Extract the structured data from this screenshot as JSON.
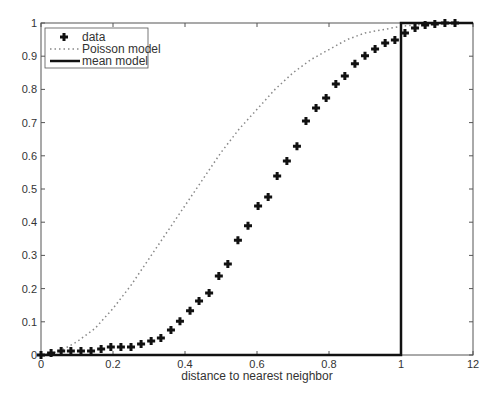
{
  "chart_data": {
    "type": "line",
    "title": "",
    "xlabel": "distance to nearest neighbor",
    "ylabel": "",
    "xlim": [
      0,
      1.2
    ],
    "ylim": [
      0,
      1
    ],
    "xticks": [
      "0",
      "0.2",
      "0.4",
      "0.6",
      "0.8",
      "1",
      "1.2"
    ],
    "yticks": [
      "0",
      "0.1",
      "0.2",
      "0.3",
      "0.4",
      "0.5",
      "0.6",
      "0.7",
      "0.8",
      "0.9",
      "1"
    ],
    "grid": false,
    "legend_position": "upper-left",
    "legend": [
      "data",
      "Poisson model",
      "mean model"
    ],
    "series": [
      {
        "name": "data",
        "style": "markers-plus",
        "x": [
          0,
          0.028,
          0.056,
          0.083,
          0.111,
          0.139,
          0.167,
          0.194,
          0.222,
          0.25,
          0.278,
          0.306,
          0.333,
          0.361,
          0.386,
          0.414,
          0.439,
          0.467,
          0.494,
          0.519,
          0.547,
          0.575,
          0.603,
          0.631,
          0.656,
          0.683,
          0.711,
          0.736,
          0.764,
          0.792,
          0.819,
          0.844,
          0.872,
          0.9,
          0.928,
          0.956,
          0.983,
          1.011,
          1.039,
          1.067,
          1.094,
          1.122,
          1.15
        ],
        "y": [
          0,
          0.006,
          0.012,
          0.012,
          0.012,
          0.012,
          0.018,
          0.024,
          0.024,
          0.024,
          0.033,
          0.042,
          0.051,
          0.075,
          0.102,
          0.133,
          0.163,
          0.187,
          0.238,
          0.274,
          0.346,
          0.389,
          0.449,
          0.476,
          0.539,
          0.584,
          0.629,
          0.705,
          0.744,
          0.774,
          0.816,
          0.84,
          0.877,
          0.901,
          0.922,
          0.94,
          0.949,
          0.97,
          0.985,
          0.994,
          0.997,
          1.0,
          1.0
        ]
      },
      {
        "name": "Poisson model",
        "style": "dotted",
        "x": [
          0,
          0.05,
          0.1,
          0.15,
          0.2,
          0.25,
          0.3,
          0.35,
          0.4,
          0.45,
          0.5,
          0.55,
          0.6,
          0.65,
          0.7,
          0.75,
          0.8,
          0.85,
          0.9,
          0.95,
          1.0,
          1.05,
          1.1,
          1.15
        ],
        "y": [
          0,
          0.01,
          0.04,
          0.08,
          0.14,
          0.21,
          0.29,
          0.37,
          0.45,
          0.53,
          0.61,
          0.68,
          0.74,
          0.8,
          0.85,
          0.89,
          0.92,
          0.95,
          0.97,
          0.98,
          0.99,
          0.995,
          1.0,
          1.0
        ]
      },
      {
        "name": "mean model",
        "style": "solid-thick",
        "x": [
          0,
          1,
          1,
          1.2
        ],
        "y": [
          0,
          0,
          1,
          1
        ]
      }
    ]
  }
}
